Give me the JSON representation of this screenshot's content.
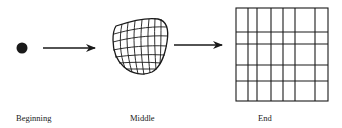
{
  "diagram": {
    "type": "process-flow",
    "stages": [
      {
        "id": "beginning",
        "label": "Beginning",
        "shape": "dot"
      },
      {
        "id": "middle",
        "label": "Middle",
        "shape": "warped-grid"
      },
      {
        "id": "end",
        "label": "End",
        "shape": "rectangular-grid"
      }
    ],
    "connectors": [
      {
        "from": "beginning",
        "to": "middle",
        "type": "arrow"
      },
      {
        "from": "middle",
        "to": "end",
        "type": "arrow"
      }
    ],
    "colors": {
      "ink": "#1a1a1a",
      "background": "#ffffff"
    }
  }
}
